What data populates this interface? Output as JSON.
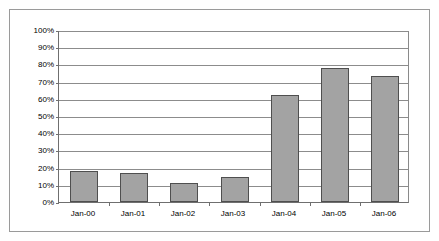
{
  "chart_data": {
    "type": "bar",
    "title": "",
    "subtitle": "",
    "xlabel": "",
    "ylabel": "",
    "categories": [
      "Jan-00",
      "Jan-01",
      "Jan-02",
      "Jan-03",
      "Jan-04",
      "Jan-05",
      "Jan-06"
    ],
    "values": [
      18,
      17,
      11,
      14.5,
      62,
      78,
      73
    ],
    "value_suffix": "%",
    "ylim": [
      0,
      100
    ],
    "ytick_step": 10,
    "ytick_labels": [
      "100%",
      "90%",
      "80%",
      "70%",
      "60%",
      "50%",
      "40%",
      "30%",
      "20%",
      "10%",
      "0%"
    ],
    "ytick_values": [
      100,
      90,
      80,
      70,
      60,
      50,
      40,
      30,
      20,
      10,
      0
    ],
    "grid": true,
    "grid_axis": "y",
    "legend": false,
    "legend_position": "none",
    "annotations": [],
    "colors": {
      "bar_fill": "#a3a3a3",
      "bar_border": "#4f4f4f",
      "gridline": "#8c8c8c",
      "axis": "#6f6f6f",
      "frame_border": "#9a9a9a",
      "background": "#ffffff",
      "text": "#000000"
    }
  }
}
